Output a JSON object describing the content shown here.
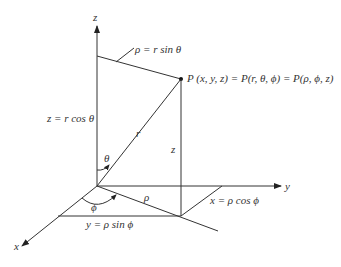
{
  "diagram": {
    "axes": {
      "x": "x",
      "y": "y",
      "z": "z"
    },
    "labels": {
      "rho_eq": "ρ = r sin θ",
      "point": "P (x, y, z) = P(r, θ, ϕ) = P(ρ, ϕ, z)",
      "z_eq": "z = r cos θ",
      "r": "r",
      "z": "z",
      "theta": "θ",
      "phi": "ϕ",
      "rho": "ρ",
      "x_eq": "x = ρ cos ϕ",
      "y_eq": "y = ρ sin ϕ"
    },
    "stroke_color": "#333333",
    "background": "#ffffff"
  }
}
